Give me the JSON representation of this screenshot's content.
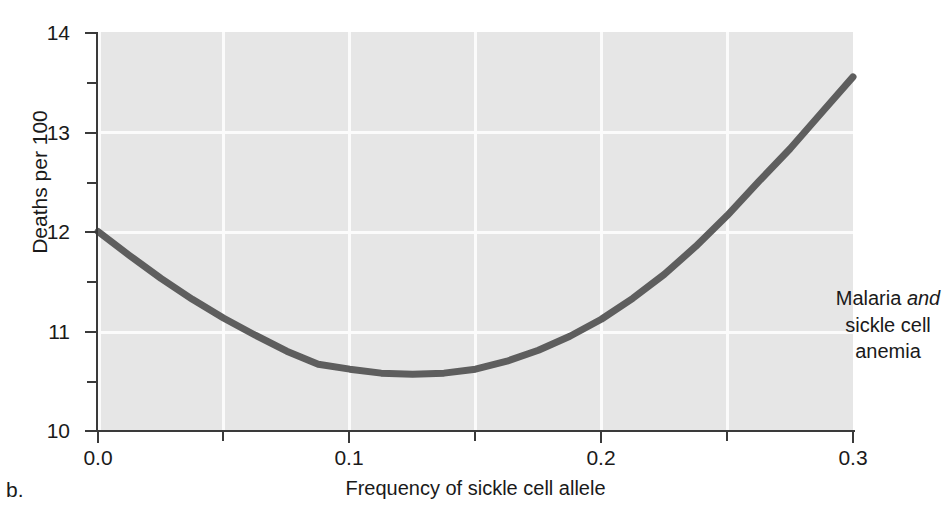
{
  "figure": {
    "letter": "b."
  },
  "annotation": {
    "line1_a": "Malaria ",
    "line1_b": "and",
    "line2": "sickle cell",
    "line3": "anemia"
  },
  "axes": {
    "xlabel": "Frequency of sickle cell allele",
    "ylabel": "Deaths per 100",
    "x_ticks": [
      "0.0",
      "0.1",
      "0.2",
      "0.3"
    ],
    "y_ticks": [
      "14",
      "13",
      "12",
      "11",
      "10"
    ]
  },
  "colors": {
    "plot_background": "#e6e6e6",
    "gridline": "#fbfbfb",
    "curve": "#5e5e5e",
    "axis": "#3a3a3a",
    "text": "#1a1a1a"
  },
  "chart_data": {
    "type": "line",
    "title": "",
    "subtitle": "",
    "xlabel": "Frequency of sickle cell allele",
    "ylabel": "Deaths per 100",
    "xlim": [
      0.0,
      0.3
    ],
    "ylim": [
      10,
      14
    ],
    "xticks": [
      0.0,
      0.1,
      0.2,
      0.3
    ],
    "xticklabels": [
      "0.0",
      "0.1",
      "0.2",
      "0.3"
    ],
    "x_minor_ticks": [
      0.05,
      0.15,
      0.25
    ],
    "yticks": [
      10,
      11,
      12,
      13,
      14
    ],
    "yticklabels": [
      "10",
      "11",
      "12",
      "13",
      "14"
    ],
    "y_minor_ticks": [
      10.5,
      11.5,
      12.5,
      13.5
    ],
    "grid": true,
    "grid_color": "#ffffff",
    "legend": null,
    "annotations": [
      {
        "text": "Malaria and sickle cell anemia",
        "x": 0.255,
        "y": 11.55,
        "italic_words": [
          "and"
        ]
      }
    ],
    "series": [
      {
        "name": "Deaths per 100",
        "color": "#5e5e5e",
        "linewidth": 7,
        "x": [
          0.0,
          0.0125,
          0.025,
          0.0375,
          0.05,
          0.0625,
          0.075,
          0.0875,
          0.1,
          0.1125,
          0.125,
          0.1375,
          0.15,
          0.1625,
          0.175,
          0.1875,
          0.2,
          0.2125,
          0.225,
          0.2375,
          0.25,
          0.2625,
          0.275,
          0.2875,
          0.3
        ],
        "y": [
          12.0,
          11.76,
          11.53,
          11.32,
          11.13,
          10.96,
          10.8,
          10.67,
          10.62,
          10.58,
          10.57,
          10.58,
          10.62,
          10.7,
          10.81,
          10.95,
          11.12,
          11.33,
          11.57,
          11.85,
          12.16,
          12.5,
          12.83,
          13.19,
          13.55
        ]
      }
    ]
  }
}
